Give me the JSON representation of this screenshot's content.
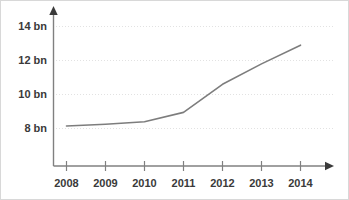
{
  "chart_data": {
    "type": "line",
    "title": "",
    "subtitle": "",
    "xlabel": "",
    "ylabel": "",
    "categories": [
      "2008",
      "2009",
      "2010",
      "2011",
      "2012",
      "2013",
      "2014"
    ],
    "x": [
      2008,
      2009,
      2010,
      2011,
      2012,
      2013,
      2014
    ],
    "values": [
      8.15,
      8.25,
      8.4,
      8.95,
      10.6,
      11.8,
      12.9
    ],
    "series": [
      {
        "name": "",
        "values": [
          8.15,
          8.25,
          8.4,
          8.95,
          10.6,
          11.8,
          12.9
        ]
      }
    ],
    "unit": "bn",
    "ylim": [
      6.0,
      14.7
    ],
    "xlim": [
      2007.7,
      2014.8
    ],
    "yticks": [
      8,
      10,
      12,
      14
    ],
    "ytick_labels": [
      "8 bn",
      "10 bn",
      "12 bn",
      "14 bn"
    ],
    "xticks": [
      2008,
      2009,
      2010,
      2011,
      2012,
      2013,
      2014
    ],
    "xtick_labels": [
      "2008",
      "2009",
      "2010",
      "2011",
      "2012",
      "2013",
      "2014"
    ],
    "grid": true,
    "grid_axis": "y",
    "legend": false,
    "legend_position": "none",
    "annotations": [],
    "line_color": "#7d7d7d",
    "grid_color": "#e2e2e2",
    "axis_color": "#808080",
    "label_color": "#3a3a3a",
    "background_color": "#ffffff",
    "markers": false,
    "axis_arrows": true
  },
  "axis": {
    "y_arrow_name": "y-axis-arrow",
    "x_arrow_name": "x-axis-arrow"
  }
}
